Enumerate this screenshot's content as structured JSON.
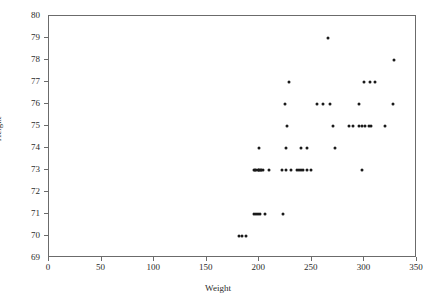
{
  "chart_data": {
    "type": "scatter",
    "title": "",
    "xlabel": "Weight",
    "ylabel": "Height",
    "xlim": [
      0,
      350
    ],
    "ylim": [
      69,
      80
    ],
    "xticks": [
      0,
      50,
      100,
      150,
      200,
      250,
      300,
      350
    ],
    "yticks": [
      69,
      70,
      71,
      72,
      73,
      74,
      75,
      76,
      77,
      78,
      79,
      80
    ],
    "grid": false,
    "legend": null,
    "marker": {
      "shape": "circle",
      "color": "#1a1a1a",
      "size_px": 3
    },
    "frame_color": "#6b6b6b",
    "background": "#ffffff",
    "series": [
      {
        "name": "players",
        "x": [
          181,
          184,
          187,
          195,
          197,
          199,
          201,
          205,
          223,
          196,
          199,
          200,
          202,
          204,
          225,
          195,
          197,
          200,
          202,
          209,
          222,
          230,
          236,
          238,
          240,
          242,
          245,
          249,
          298,
          200,
          225,
          240,
          245,
          272,
          226,
          270,
          285,
          289,
          295,
          298,
          301,
          304,
          306,
          320,
          224,
          255,
          261,
          267,
          295,
          327,
          228,
          300,
          305,
          310,
          328,
          265
        ],
        "y": [
          70,
          70,
          70,
          71,
          71,
          71,
          71,
          71,
          71,
          73,
          73,
          73,
          73,
          73,
          73,
          73,
          73,
          73,
          73,
          73,
          73,
          73,
          73,
          73,
          73,
          73,
          73,
          73,
          73,
          74,
          74,
          74,
          74,
          74,
          75,
          75,
          75,
          75,
          75,
          75,
          75,
          75,
          75,
          75,
          76,
          76,
          76,
          76,
          76,
          76,
          77,
          77,
          77,
          77,
          78,
          79
        ]
      }
    ]
  },
  "axes": {
    "xlabel": "Weight",
    "ylabel": "Height",
    "xticklabels": [
      "0",
      "50",
      "100",
      "150",
      "200",
      "250",
      "300",
      "350"
    ],
    "yticklabels": [
      "69",
      "70",
      "71",
      "72",
      "73",
      "74",
      "75",
      "76",
      "77",
      "78",
      "79",
      "80"
    ]
  }
}
